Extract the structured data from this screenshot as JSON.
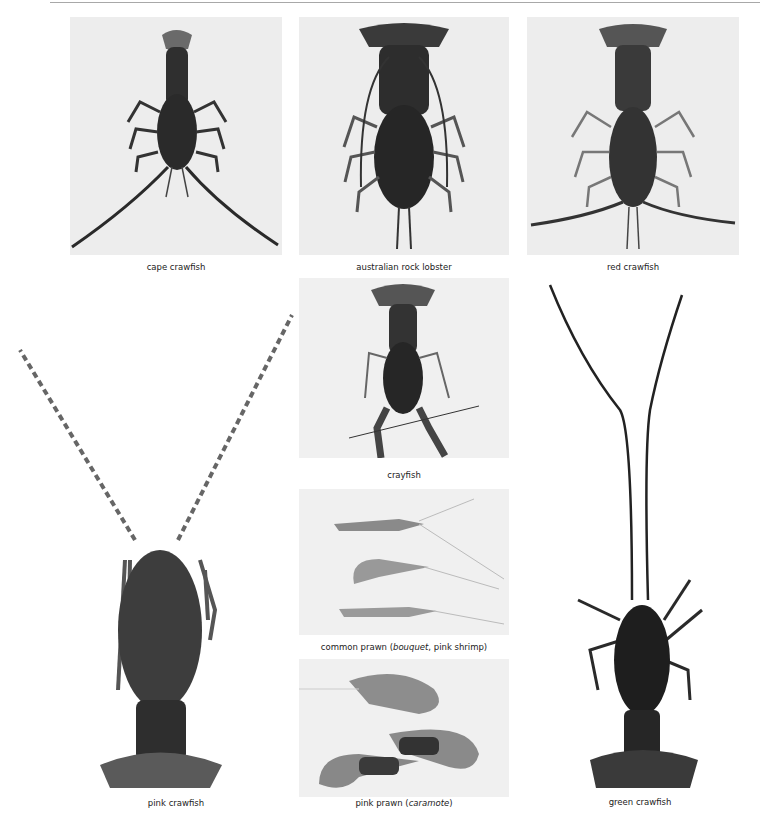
{
  "page": {
    "items": [
      {
        "id": "cape-crawfish",
        "caption": "cape crawfish"
      },
      {
        "id": "australian-rock-lobster",
        "caption": "australian rock lobster"
      },
      {
        "id": "red-crawfish",
        "caption": "red crawfish"
      },
      {
        "id": "pink-crawfish",
        "caption": "pink crawfish"
      },
      {
        "id": "crayfish",
        "caption": "crayfish"
      },
      {
        "id": "common-prawn",
        "caption_main": "common prawn (",
        "caption_italic": "bouquet",
        "caption_rest": ", pink shrimp)"
      },
      {
        "id": "pink-prawn",
        "caption_main": "pink prawn (",
        "caption_italic": "caramote",
        "caption_rest": ")"
      },
      {
        "id": "green-crawfish",
        "caption": "green crawfish"
      }
    ]
  },
  "colors": {
    "rule": "#a8a8a8",
    "photo_bg": "#ededed",
    "shell_dark": "#2a2a2a",
    "shell_mid": "#4a4a4a",
    "prawn": "#9a9a9a"
  }
}
